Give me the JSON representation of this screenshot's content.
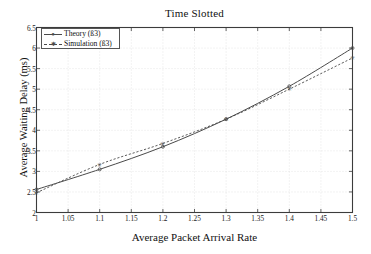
{
  "chart_data": {
    "type": "line",
    "title": "Time Slotted",
    "xlabel": "Average Packet Arrival Rate",
    "ylabel": "Average Waiting Delay (ms)",
    "xlim": [
      1,
      1.5
    ],
    "ylim": [
      2,
      6.5
    ],
    "grid": true,
    "legend_position": "upper-left",
    "xticks": [
      "1",
      "1.05",
      "1.1",
      "1.15",
      "1.2",
      "1.25",
      "1.3",
      "1.35",
      "1.4",
      "1.45",
      "1.5"
    ],
    "xtick_values": [
      1,
      1.05,
      1.1,
      1.15,
      1.2,
      1.25,
      1.3,
      1.35,
      1.4,
      1.45,
      1.5
    ],
    "yticks": [
      "2",
      "2.5",
      "3",
      "3.5",
      "4",
      "4.5",
      "5",
      "5.5",
      "6",
      "6.5"
    ],
    "ytick_values": [
      2,
      2.5,
      3,
      3.5,
      4,
      4.5,
      5,
      5.5,
      6,
      6.5
    ],
    "x": [
      1,
      1.1,
      1.2,
      1.3,
      1.4,
      1.5
    ],
    "series": [
      {
        "name": "Theory (ß3)",
        "style": "solid",
        "marker": "dot",
        "color": "#4a4a4a",
        "values": [
          2.56,
          3.05,
          3.6,
          4.27,
          5.07,
          6.0
        ]
      },
      {
        "name": "Simulation (ß3)",
        "style": "dashed",
        "marker": "star",
        "color": "#4a4a4a",
        "values": [
          2.48,
          3.17,
          3.68,
          4.27,
          5.0,
          5.76
        ]
      }
    ]
  },
  "axes": {
    "title": "Time Slotted",
    "xlabel": "Average Packet Arrival Rate",
    "ylabel": "Average Waiting Delay (ms)"
  },
  "legend": {
    "entries": [
      {
        "label": "Theory (ß3)"
      },
      {
        "label": "Simulation (ß3)"
      }
    ]
  },
  "colors": {
    "line": "#4a4a4a",
    "axis": "#3c3c3c",
    "grid": "#cfcfcf",
    "background": "#ffffff"
  }
}
